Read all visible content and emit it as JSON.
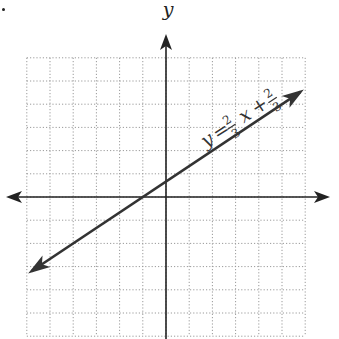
{
  "chart_data": {
    "type": "line",
    "title": "",
    "xlabel": "",
    "ylabel": "y",
    "xlim": [
      -6,
      6
    ],
    "ylim": [
      -6,
      6
    ],
    "grid": true,
    "grid_style": "dotted",
    "grid_step": 1,
    "axes_arrows": true,
    "series": [
      {
        "name": "y = (2/3)x + 2/3",
        "slope": 0.6667,
        "intercept": 0.6667,
        "x": [
          -6,
          -1,
          0,
          6
        ],
        "y": [
          -3.333,
          0,
          0.667,
          4.667
        ],
        "arrows_both_ends": true,
        "drawn_from_x": -5.8,
        "drawn_to_x": 5.8,
        "color": "#333333"
      }
    ],
    "annotations": [
      {
        "text": "y = 2/3 x + 2/3",
        "position": "along line, upper right",
        "rotated": true
      }
    ]
  },
  "labels": {
    "y_axis": "y",
    "equation_lhs": "y",
    "equation_eq": "=",
    "frac1_num": "2",
    "frac1_den": "3",
    "var_x": "x",
    "plus": "+",
    "frac2_num": "2",
    "frac2_den": "3"
  },
  "colors": {
    "axis": "#222222",
    "grid": "#9a9a9a",
    "line": "#333333"
  }
}
